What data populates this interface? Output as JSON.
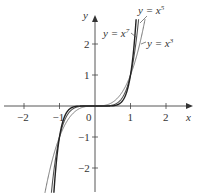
{
  "chart_data": {
    "type": "line",
    "title": "",
    "xlabel": "x",
    "ylabel": "y",
    "xlim": [
      -2.6,
      2.6
    ],
    "ylim": [
      -2.8,
      2.8
    ],
    "grid": false,
    "x_ticks": [
      -2,
      -1,
      0,
      1,
      2
    ],
    "x_tick_labels": [
      "−2",
      "−1",
      "0",
      "1",
      "2"
    ],
    "y_ticks": [
      -2,
      -1,
      1,
      2
    ],
    "y_tick_labels": [
      "−2",
      "−1",
      "1",
      "2"
    ],
    "series": [
      {
        "name": "y = x^3",
        "label": "y = x",
        "exponent_label": "3",
        "power": 3,
        "color": "#777777",
        "width": 1.0
      },
      {
        "name": "y = x^5",
        "label": "y = x",
        "exponent_label": "5",
        "power": 5,
        "color": "#555555",
        "width": 1.1
      },
      {
        "name": "y = x^7",
        "label": "y = x",
        "exponent_label": "7",
        "power": 7,
        "color": "#222222",
        "width": 1.4
      }
    ],
    "annotations": [
      {
        "text": "y = x^5",
        "near": [
          1.15,
          2.6
        ]
      },
      {
        "text": "y = x^7",
        "near": [
          0.55,
          2.1
        ]
      },
      {
        "text": "y = x^3",
        "near": [
          1.45,
          2.0
        ]
      }
    ]
  }
}
